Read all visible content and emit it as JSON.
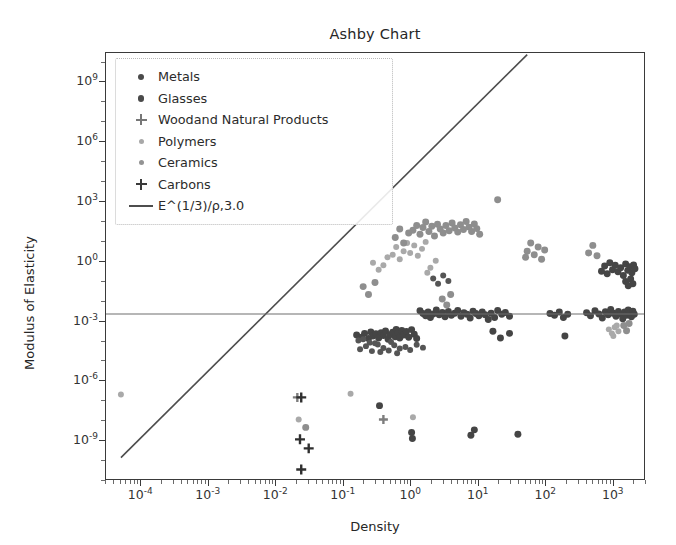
{
  "chart_data": {
    "type": "scatter",
    "title": "Ashby Chart",
    "xlabel": "Density",
    "ylabel": "Modulus of Elasticity",
    "xscale": "log",
    "yscale": "log",
    "xlim": [
      3e-05,
      3000
    ],
    "ylim": [
      1e-11,
      30000000000.0
    ],
    "grid": false,
    "legend_position": "upper left",
    "xticks": [
      "10⁻⁴",
      "10⁻³",
      "10⁻²",
      "10⁻¹",
      "10⁰",
      "10¹",
      "10²",
      "10³"
    ],
    "xtick_values": [
      0.0001,
      0.001,
      0.01,
      0.1,
      1,
      10,
      100,
      1000
    ],
    "yticks": [
      "10⁹",
      "10⁶",
      "10³",
      "10⁰",
      "10⁻³",
      "10⁻⁶",
      "10⁻⁹"
    ],
    "ytick_values": [
      1000000000.0,
      1000000.0,
      1000.0,
      1.0,
      0.001,
      1e-06,
      1e-09
    ],
    "legend": [
      {
        "label": "Metals",
        "marker": "circle",
        "color": "#4a4a4a"
      },
      {
        "label": "Glasses",
        "marker": "circle",
        "color": "#4a4a4a"
      },
      {
        "label": "Woodand Natural Products",
        "marker": "plus",
        "color": "#777777"
      },
      {
        "label": "Polymers",
        "marker": "circle-small",
        "color": "#a8a8a8"
      },
      {
        "label": "Ceramics",
        "marker": "circle-small",
        "color": "#939393"
      },
      {
        "label": "Carbons",
        "marker": "plus",
        "color": "#3a3a3a"
      },
      {
        "label": "E^(1/3)/ρ,3.0",
        "marker": "line",
        "color": "#4d4d4d"
      }
    ],
    "guide_lines": [
      {
        "name": "E^(1/3)/ρ,3.0",
        "kind": "diagonal",
        "color": "#4d4d4d",
        "x_start": 5e-05,
        "y_start": 1.2e-10,
        "x_end": 55.0,
        "y_end": 25000000000.0
      },
      {
        "name": "modulus-reference",
        "kind": "horizontal",
        "color": "#6e6e6e",
        "y_value": 0.0021
      }
    ],
    "series": [
      {
        "name": "Metals",
        "color": "#454545",
        "marker": "circle",
        "size": 7,
        "points": [
          [
            0.16,
            0.00018
          ],
          [
            0.19,
            0.00014
          ],
          [
            0.21,
            0.00022
          ],
          [
            0.24,
            0.00012
          ],
          [
            0.26,
            0.00026
          ],
          [
            0.28,
            0.00016
          ],
          [
            0.31,
            0.00021
          ],
          [
            0.34,
            0.00013
          ],
          [
            0.37,
            0.00024
          ],
          [
            0.4,
            0.00017
          ],
          [
            0.43,
            0.00029
          ],
          [
            0.47,
            0.00011
          ],
          [
            0.5,
            0.00019
          ],
          [
            0.55,
            0.00025
          ],
          [
            0.6,
            0.00015
          ],
          [
            0.62,
            0.00035
          ],
          [
            0.66,
            0.00023
          ],
          [
            0.7,
            0.00013
          ],
          [
            0.75,
            0.00031
          ],
          [
            0.8,
            0.00018
          ],
          [
            0.88,
            0.00027
          ],
          [
            0.95,
            0.00014
          ],
          [
            1.05,
            0.00034
          ],
          [
            1.15,
            0.0002
          ],
          [
            1.25,
            0.00012
          ],
          [
            1.4,
            0.003
          ],
          [
            1.55,
            0.0022
          ],
          [
            1.7,
            0.0017
          ],
          [
            1.85,
            0.0026
          ],
          [
            2.0,
            0.0014
          ],
          [
            2.2,
            0.0021
          ],
          [
            2.45,
            0.0033
          ],
          [
            2.7,
            0.0019
          ],
          [
            3.0,
            0.0025
          ],
          [
            3.3,
            0.0015
          ],
          [
            3.7,
            0.0028
          ],
          [
            4.1,
            0.0018
          ],
          [
            4.6,
            0.0023
          ],
          [
            5.1,
            0.0031
          ],
          [
            5.7,
            0.0016
          ],
          [
            6.3,
            0.0024
          ],
          [
            7.0,
            0.002
          ],
          [
            7.8,
            0.0013
          ],
          [
            8.6,
            0.0029
          ],
          [
            9.5,
            0.0022
          ],
          [
            10.5,
            0.0017
          ],
          [
            11.8,
            0.0026
          ],
          [
            13.0,
            0.0019
          ],
          [
            14.5,
            0.0011
          ],
          [
            16.0,
            0.0023
          ],
          [
            18.0,
            0.0014
          ],
          [
            20.0,
            0.0031
          ],
          [
            23.0,
            0.002
          ],
          [
            26.0,
            0.0025
          ],
          [
            30.0,
            0.0016
          ],
          [
            120.0,
            0.0022
          ],
          [
            140.0,
            0.0018
          ],
          [
            165.0,
            0.0026
          ],
          [
            190.0,
            0.0014
          ],
          [
            220.0,
            0.002
          ],
          [
            420.0,
            0.0024
          ],
          [
            480.0,
            0.0017
          ],
          [
            560.0,
            0.003
          ],
          [
            640.0,
            0.0021
          ],
          [
            720.0,
            0.0013
          ],
          [
            800.0,
            0.0027
          ],
          [
            880.0,
            0.0019
          ],
          [
            960.0,
            0.0035
          ],
          [
            1050.0,
            0.0023
          ],
          [
            1150.0,
            0.0016
          ],
          [
            1250.0,
            0.0028
          ],
          [
            1350.0,
            0.0021
          ],
          [
            1450.0,
            0.0012
          ],
          [
            1550.0,
            0.0026
          ],
          [
            1650.0,
            0.0018
          ],
          [
            1750.0,
            0.0033
          ],
          [
            1850.0,
            0.0022
          ],
          [
            1950.0,
            0.0015
          ],
          [
            2050.0,
            0.0029
          ],
          [
            2150.0,
            0.002
          ],
          [
            700.0,
            0.3
          ],
          [
            780.0,
            0.55
          ],
          [
            850.0,
            0.22
          ],
          [
            930.0,
            0.8
          ],
          [
            1020.0,
            0.35
          ],
          [
            1120.0,
            0.6
          ],
          [
            1230.0,
            0.28
          ],
          [
            1350.0,
            0.45
          ],
          [
            1480.0,
            0.18
          ],
          [
            1600.0,
            0.7
          ],
          [
            1720.0,
            0.33
          ],
          [
            1850.0,
            0.5
          ],
          [
            1980.0,
            0.25
          ],
          [
            2100.0,
            0.62
          ],
          [
            2200.0,
            0.4
          ],
          [
            1600.0,
            0.09
          ],
          [
            1750.0,
            0.055
          ],
          [
            1900.0,
            0.12
          ],
          [
            2050.0,
            0.07
          ],
          [
            200.0,
            0.00016
          ],
          [
            30.0,
            0.00022
          ],
          [
            22.0,
            0.00013
          ],
          [
            17.0,
            0.00028
          ],
          [
            1.05,
            2.2e-09
          ],
          [
            1.08,
            1.1e-09
          ],
          [
            8.0,
            1.6e-09
          ],
          [
            9.0,
            3e-09
          ],
          [
            0.35,
            5e-08
          ],
          [
            40.0,
            1.8e-09
          ]
        ]
      },
      {
        "name": "Glasses",
        "color": "#555555",
        "marker": "circle",
        "size": 6,
        "points": [
          [
            0.18,
            3.5e-05
          ],
          [
            0.22,
            5e-05
          ],
          [
            0.27,
            2.8e-05
          ],
          [
            0.33,
            6e-05
          ],
          [
            0.4,
            4e-05
          ],
          [
            0.48,
            3e-05
          ],
          [
            0.58,
            5.5e-05
          ],
          [
            0.7,
            3.8e-05
          ],
          [
            0.85,
            4.5e-05
          ],
          [
            1.0,
            3.2e-05
          ],
          [
            1.25,
            5.8e-05
          ],
          [
            1.55,
            4.2e-05
          ],
          [
            0.3,
            7e-05
          ],
          [
            0.36,
            2.5e-05
          ],
          [
            0.52,
            8e-05
          ],
          [
            0.64,
            2.2e-05
          ],
          [
            2.2,
            0.13
          ],
          [
            2.6,
            0.07
          ],
          [
            3.1,
            0.18
          ],
          [
            3.7,
            0.095
          ],
          [
            0.17,
            9.5e-05
          ],
          [
            0.2,
            0.00011
          ],
          [
            0.25,
            7.5e-05
          ]
        ]
      },
      {
        "name": "Woodand Natural Products",
        "color": "#7d7d7d",
        "marker": "plus",
        "size": 9,
        "points": [
          [
            0.021,
            1.3e-07
          ],
          [
            0.4,
            1e-08
          ]
        ]
      },
      {
        "name": "Polymers",
        "color": "#a9a9a9",
        "marker": "circle",
        "size": 6,
        "points": [
          [
            5e-05,
            1.8e-07
          ],
          [
            0.022,
            1e-08
          ],
          [
            0.13,
            2e-07
          ],
          [
            1.1,
            1.3e-08
          ],
          [
            0.55,
            2.0
          ],
          [
            0.62,
            5.0
          ],
          [
            0.7,
            1.2
          ],
          [
            0.8,
            3.0
          ],
          [
            0.9,
            8.0
          ],
          [
            1.0,
            2.5
          ],
          [
            1.15,
            6.0
          ],
          [
            1.3,
            1.8
          ],
          [
            1.5,
            4.0
          ],
          [
            1.7,
            9.0
          ],
          [
            0.4,
            0.6
          ],
          [
            0.46,
            1.5
          ],
          [
            0.34,
            0.35
          ],
          [
            0.28,
            0.8
          ],
          [
            2.0,
            0.45
          ],
          [
            2.4,
            1.0
          ],
          [
            1.8,
            0.25
          ],
          [
            900.0,
            0.00035
          ],
          [
            1000.0,
            0.00022
          ],
          [
            1100.0,
            0.00045
          ],
          [
            1250.0,
            0.00028
          ],
          [
            1050.0,
            0.00016
          ],
          [
            1180.0,
            0.00055
          ]
        ]
      },
      {
        "name": "Ceramics",
        "color": "#8e8e8e",
        "marker": "circle",
        "size": 7,
        "points": [
          [
            1.1,
            35.0
          ],
          [
            1.25,
            60.0
          ],
          [
            1.4,
            22.0
          ],
          [
            1.55,
            48.0
          ],
          [
            1.7,
            90.0
          ],
          [
            1.9,
            30.0
          ],
          [
            2.1,
            55.0
          ],
          [
            2.3,
            18.0
          ],
          [
            2.55,
            70.0
          ],
          [
            2.8,
            40.0
          ],
          [
            3.1,
            25.0
          ],
          [
            3.4,
            60.0
          ],
          [
            3.8,
            33.0
          ],
          [
            4.2,
            80.0
          ],
          [
            4.6,
            45.0
          ],
          [
            5.1,
            28.0
          ],
          [
            5.6,
            65.0
          ],
          [
            6.2,
            38.0
          ],
          [
            6.8,
            95.0
          ],
          [
            7.5,
            50.0
          ],
          [
            8.2,
            30.0
          ],
          [
            9.0,
            72.0
          ],
          [
            9.8,
            42.0
          ],
          [
            10.8,
            22.0
          ],
          [
            0.6,
            15.0
          ],
          [
            0.7,
            40.0
          ],
          [
            0.8,
            8.0
          ],
          [
            0.95,
            25.0
          ],
          [
            20.0,
            1200.0
          ],
          [
            55.0,
            3.0
          ],
          [
            62.0,
            8.0
          ],
          [
            70.0,
            2.0
          ],
          [
            80.0,
            5.0
          ],
          [
            90.0,
            1.2
          ],
          [
            100.0,
            3.5
          ],
          [
            52.0,
            1.5
          ],
          [
            450.0,
            2.5
          ],
          [
            520.0,
            6.0
          ],
          [
            600.0,
            1.8
          ],
          [
            0.2,
            0.05
          ],
          [
            0.24,
            0.02
          ],
          [
            0.3,
            0.08
          ],
          [
            3.0,
            0.012
          ],
          [
            3.5,
            0.006
          ],
          [
            4.0,
            0.02
          ],
          [
            1500.0,
            0.00055
          ],
          [
            1650.0,
            0.0003
          ],
          [
            1800.0,
            0.0007
          ],
          [
            0.028,
            4e-09
          ]
        ]
      },
      {
        "name": "Carbons",
        "color": "#2f2f2f",
        "marker": "plus",
        "size": 10,
        "points": [
          [
            0.024,
            1.3e-07
          ],
          [
            0.023,
            1e-09
          ],
          [
            0.031,
            3.5e-10
          ],
          [
            0.024,
            3e-11
          ]
        ]
      }
    ]
  }
}
